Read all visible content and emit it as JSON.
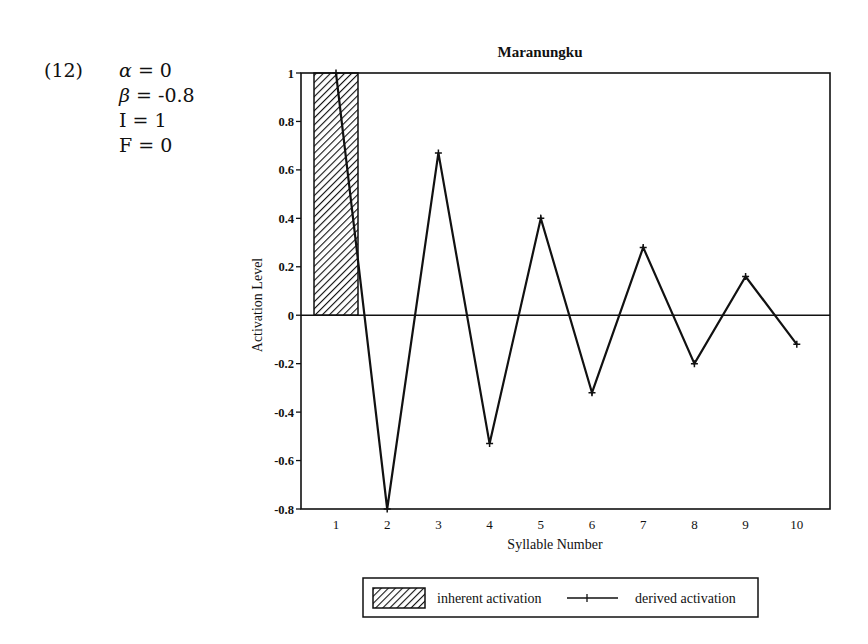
{
  "example_number": "(12)",
  "parameters": [
    {
      "symbol": "α",
      "italic": true,
      "value": "0"
    },
    {
      "symbol": "β",
      "italic": true,
      "value": "-0.8"
    },
    {
      "symbol": "I",
      "italic": false,
      "value": "1"
    },
    {
      "symbol": "F",
      "italic": false,
      "value": "0"
    }
  ],
  "chart_data": {
    "type": "bar+line",
    "title": "Maranungku",
    "xlabel": "Syllable Number",
    "ylabel": "Activation Level",
    "categories": [
      "1",
      "2",
      "3",
      "4",
      "5",
      "6",
      "7",
      "8",
      "9",
      "10"
    ],
    "ylim": [
      -0.8,
      1
    ],
    "yticks": [
      "1",
      "0.8",
      "0.6",
      "0.4",
      "0.2",
      "0",
      "-0.2",
      "-0.4",
      "-0.6",
      "-0.8"
    ],
    "ytick_values": [
      1,
      0.8,
      0.6,
      0.4,
      0.2,
      0,
      -0.2,
      -0.4,
      -0.6,
      -0.8
    ],
    "grid": false,
    "series": [
      {
        "name": "inherent activation",
        "kind": "bar",
        "pattern": "diagonal-hatch",
        "values": [
          1,
          0,
          0,
          0,
          0,
          0,
          0,
          0,
          0,
          0
        ]
      },
      {
        "name": "derived activation",
        "kind": "line",
        "marker": "plus",
        "values": [
          1,
          -0.8,
          0.67,
          -0.53,
          0.4,
          -0.32,
          0.28,
          -0.2,
          0.16,
          -0.12
        ]
      }
    ],
    "legend": {
      "placement": "bottom-center",
      "entries": [
        "inherent activation",
        "derived activation"
      ]
    },
    "colors": {
      "ink": "#111111",
      "background": "#ffffff"
    }
  }
}
